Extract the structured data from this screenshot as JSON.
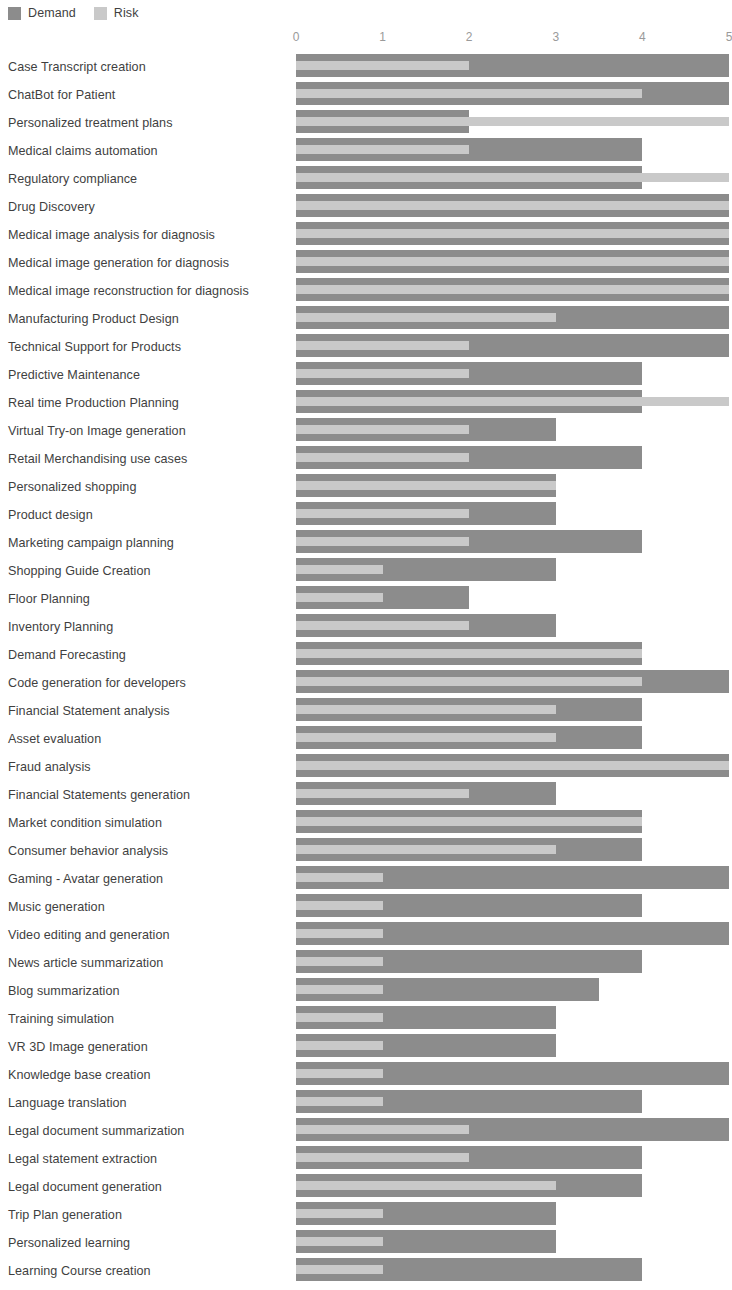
{
  "legend": {
    "items": [
      {
        "label": "Demand",
        "color": "#8c8c8c",
        "key": "demand"
      },
      {
        "label": "Risk",
        "color": "#c9c9c9",
        "key": "risk"
      }
    ]
  },
  "axis": {
    "ticks": [
      "0",
      "1",
      "2",
      "3",
      "4",
      "5"
    ],
    "min": 0,
    "max": 5,
    "position": "top"
  },
  "chart_data": {
    "type": "bar",
    "orientation": "horizontal",
    "title": "",
    "xlabel": "",
    "ylabel": "",
    "xlim": [
      0,
      5
    ],
    "grid": false,
    "legend_position": "top-left",
    "overlap": true,
    "colors": {
      "demand": "#8c8c8c",
      "risk": "#c9c9c9"
    },
    "categories": [
      "Case Transcript creation",
      "ChatBot for Patient",
      "Personalized treatment plans",
      "Medical claims automation",
      "Regulatory compliance",
      "Drug Discovery",
      "Medical image analysis for diagnosis",
      "Medical image generation for diagnosis",
      "Medical image reconstruction for diagnosis",
      "Manufacturing Product Design",
      "Technical Support for Products",
      "Predictive Maintenance",
      "Real time Production Planning",
      "Virtual Try-on Image generation",
      "Retail Merchandising use cases",
      "Personalized shopping",
      "Product design",
      "Marketing campaign planning",
      "Shopping Guide Creation",
      "Floor Planning",
      "Inventory Planning",
      "Demand Forecasting",
      "Code generation for developers",
      "Financial Statement analysis",
      "Asset evaluation",
      "Fraud analysis",
      "Financial Statements generation",
      "Market condition simulation",
      "Consumer behavior analysis",
      "Gaming - Avatar generation",
      "Music generation",
      "Video editing and generation",
      "News article summarization",
      "Blog summarization",
      "Training simulation",
      "VR 3D Image generation",
      "Knowledge base creation",
      "Language translation",
      "Legal document summarization",
      "Legal statement extraction",
      "Legal document generation",
      "Trip Plan generation",
      "Personalized learning",
      "Learning Course creation"
    ],
    "series": [
      {
        "name": "Demand",
        "values": [
          5,
          5,
          2,
          4,
          4,
          5,
          5,
          5,
          5,
          5,
          5,
          4,
          4,
          3,
          4,
          3,
          3,
          4,
          3,
          2,
          3,
          4,
          5,
          4,
          4,
          5,
          3,
          4,
          4,
          5,
          4,
          5,
          4,
          3.5,
          3,
          3,
          5,
          4,
          5,
          4,
          4,
          3,
          3,
          4
        ]
      },
      {
        "name": "Risk",
        "values": [
          2,
          4,
          5,
          2,
          5,
          5,
          5,
          5,
          5,
          3,
          2,
          2,
          5,
          2,
          2,
          3,
          2,
          2,
          1,
          1,
          2,
          4,
          4,
          3,
          3,
          5,
          2,
          4,
          3,
          1,
          1,
          1,
          1,
          1,
          1,
          1,
          1,
          1,
          2,
          2,
          3,
          1,
          1,
          1
        ]
      }
    ]
  }
}
